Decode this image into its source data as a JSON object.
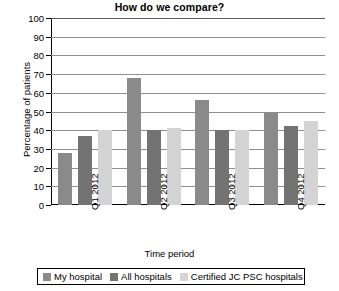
{
  "chart_data": {
    "type": "bar",
    "title": "How do we compare?",
    "xlabel": "Time period",
    "ylabel": "Percentage of patients",
    "categories": [
      "Q1 2012",
      "Q2 2012",
      "Q3 2012",
      "Q4 2012"
    ],
    "series": [
      {
        "name": "My hospital",
        "color": "#8a8a8a",
        "values": [
          28,
          68,
          56,
          49
        ]
      },
      {
        "name": "All hospitals",
        "color": "#737373",
        "values": [
          37,
          40,
          40,
          42
        ]
      },
      {
        "name": "Certified JC PSC hospitals",
        "color": "#d4d4d4",
        "values": [
          40,
          41,
          40,
          45
        ]
      }
    ],
    "ylim": [
      0,
      100
    ],
    "ytick_labels": [
      "100",
      "90",
      "80",
      "70",
      "60",
      "50",
      "40",
      "30",
      "20",
      "10",
      "0"
    ],
    "ytick_values": [
      100,
      90,
      80,
      70,
      60,
      50,
      40,
      30,
      20,
      10,
      0
    ],
    "grid": true,
    "legend_position": "bottom"
  }
}
